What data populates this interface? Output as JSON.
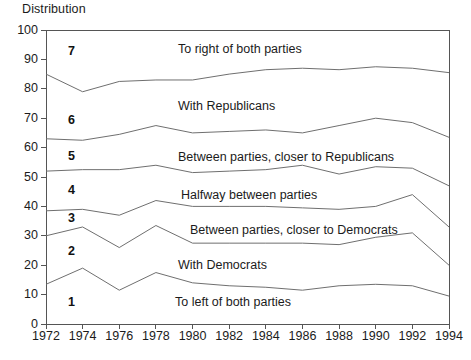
{
  "chart_data": {
    "type": "area",
    "title": "",
    "ylabel": "Distribution",
    "xlabel": "",
    "ylim": [
      0,
      100
    ],
    "yticks": [
      0,
      10,
      20,
      30,
      40,
      50,
      60,
      70,
      80,
      90,
      100
    ],
    "grid": false,
    "legend_position": "inline-bands",
    "x": [
      1972,
      1974,
      1976,
      1978,
      1980,
      1982,
      1984,
      1986,
      1988,
      1990,
      1992,
      1994
    ],
    "xticklabels": [
      "1972",
      "1974",
      "1976",
      "1978",
      "1980",
      "1982",
      "1984",
      "1986",
      "1988",
      "1990",
      "1992",
      "1994"
    ],
    "stacked": true,
    "band_numbers": [
      "1",
      "2",
      "3",
      "4",
      "5",
      "6",
      "7"
    ],
    "bands": [
      {
        "number": "1",
        "label": "To left of both parties",
        "cumulative_top": [
          13.5,
          19.0,
          11.5,
          17.5,
          14.0,
          13.0,
          12.5,
          11.5,
          13.0,
          13.5,
          13.0,
          9.5
        ]
      },
      {
        "number": "2",
        "label": "With Democrats",
        "cumulative_top": [
          30.0,
          33.0,
          26.0,
          33.5,
          27.5,
          27.5,
          27.5,
          27.5,
          27.0,
          29.5,
          31.0,
          20.0
        ]
      },
      {
        "number": "3",
        "label": "Between parties, closer to Democrats",
        "cumulative_top": [
          38.5,
          39.0,
          37.0,
          42.0,
          40.0,
          40.0,
          40.0,
          39.5,
          39.0,
          40.0,
          44.0,
          33.0
        ]
      },
      {
        "number": "4",
        "label": "Halfway between parties",
        "cumulative_top": [
          52.0,
          52.5,
          52.5,
          54.0,
          51.5,
          52.0,
          52.5,
          54.0,
          51.0,
          53.5,
          53.0,
          47.0
        ]
      },
      {
        "number": "5",
        "label": "Between parties, closer to Republicans",
        "cumulative_top": [
          63.0,
          62.5,
          64.5,
          67.5,
          65.0,
          65.5,
          66.0,
          65.0,
          67.5,
          70.0,
          68.5,
          63.5
        ]
      },
      {
        "number": "6",
        "label": "With Republicans",
        "cumulative_top": [
          85.0,
          79.0,
          82.5,
          83.0,
          83.0,
          85.0,
          86.5,
          87.0,
          86.5,
          87.5,
          87.0,
          85.5
        ]
      },
      {
        "number": "7",
        "label": "To right of both parties",
        "cumulative_top": [
          100,
          100,
          100,
          100,
          100,
          100,
          100,
          100,
          100,
          100,
          100,
          100
        ]
      }
    ]
  },
  "colors": {
    "line": "#6f6f6f",
    "axis": "#555555",
    "text": "#1b1b1b",
    "background": "#ffffff"
  }
}
